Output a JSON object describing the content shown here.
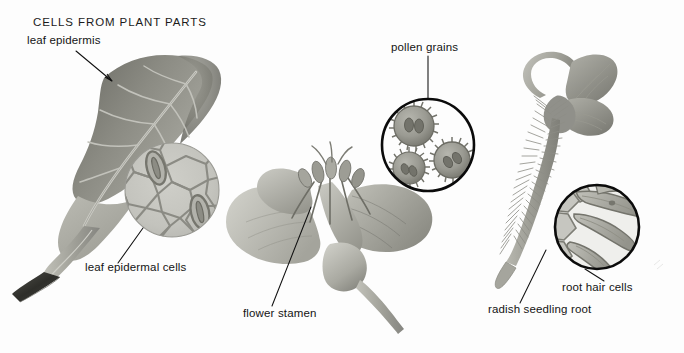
{
  "figure": {
    "title": "CELLS FROM PLANT PARTS",
    "background_color": "#fdfdfd",
    "width": 684,
    "height": 353,
    "medium": "grayscale botanical illustration / photographic plate"
  },
  "palette": {
    "ink": "#141414",
    "leader_line": "#111111",
    "inset_ring": "#0b0b0b",
    "leaf_dark": "#6e6e68",
    "leaf_mid": "#8f8f88",
    "leaf_light": "#b4b4ac",
    "inset_fill": "#c5c5c0",
    "cell_wall": "#8b8b84",
    "stoma": "#7a7a72",
    "flower_light": "#c9c9c2",
    "flower_mid": "#a8a8a0",
    "flower_dark": "#7d7d76",
    "pollen_body": "#9d9d95",
    "pollen_dark": "#6f6f68",
    "root_mid": "#a3a39b",
    "root_dark": "#77776f",
    "stem_dark": "#3a3a36"
  },
  "panels": [
    {
      "id": "leaf",
      "name": "leaf-panel",
      "subject": "leaf with epidermis and magnified epidermal cells",
      "labels": [
        "leaf epidermis",
        "leaf epidermal cells"
      ]
    },
    {
      "id": "flower",
      "name": "flower-panel",
      "subject": "flower with stamens and magnified pollen grains",
      "labels": [
        "pollen grains",
        "flower stamen"
      ]
    },
    {
      "id": "root",
      "name": "root-panel",
      "subject": "radish seedling root with magnified root hair cells",
      "labels": [
        "root hair cells",
        "radish seedling root"
      ]
    }
  ],
  "labels": {
    "leaf_epidermis": {
      "text": "leaf epidermis",
      "x": 27,
      "y": 44,
      "anchor": "start"
    },
    "leaf_epidermal_cells": {
      "text": "leaf epidermal cells",
      "x": 85,
      "y": 271,
      "anchor": "start"
    },
    "pollen_grains": {
      "text": "pollen grains",
      "x": 391,
      "y": 51,
      "anchor": "start"
    },
    "flower_stamen": {
      "text": "flower stamen",
      "x": 243,
      "y": 317,
      "anchor": "start"
    },
    "root_hair_cells": {
      "text": "root hair cells",
      "x": 562,
      "y": 291,
      "anchor": "start"
    },
    "radish_seedling_root": {
      "text": "radish seedling root",
      "x": 488,
      "y": 313,
      "anchor": "start"
    }
  },
  "insets": {
    "leaf_epidermal_cells": {
      "name": "leaf-epidermal-cells-inset",
      "cx": 172,
      "cy": 190,
      "r": 47,
      "style": "soft-edged circular magnification",
      "contents": "polygonal epidermal cells with two stomata"
    },
    "pollen_grains": {
      "name": "pollen-grains-inset",
      "cx": 428,
      "cy": 145,
      "r": 47,
      "style": "thick black ring",
      "contents": "three spiked pollen grains",
      "grain_count": 3
    },
    "root_hair_cells": {
      "name": "root-hair-cells-inset",
      "cx": 597,
      "cy": 227,
      "r": 43,
      "style": "thick black ring",
      "contents": "root cells bearing elongated root hairs"
    }
  },
  "leaders": {
    "leaf_epidermis": {
      "x1": 76,
      "y1": 51,
      "x2": 112,
      "y2": 81
    },
    "leaf_epidermal_cells": {
      "x1": 143,
      "y1": 228,
      "x2": 118,
      "y2": 263
    },
    "pollen_grains": {
      "x1": 428,
      "y1": 56,
      "x2": 428,
      "y2": 99
    },
    "flower_stamen": {
      "x1": 311,
      "y1": 207,
      "x2": 272,
      "y2": 306
    },
    "root_hair_cells": {
      "x1": 585,
      "y1": 269,
      "x2": 604,
      "y2": 281
    },
    "radish_seedling_root": {
      "x1": 546,
      "y1": 250,
      "x2": 520,
      "y2": 303
    }
  }
}
